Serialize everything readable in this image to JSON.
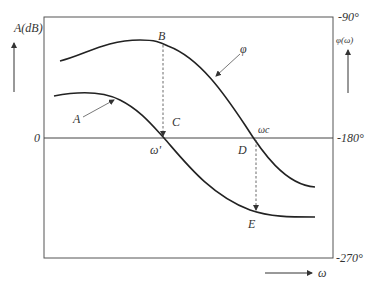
{
  "diagram": {
    "type": "bode-plot",
    "left_axis": {
      "label": "A(dB)",
      "zero_label": "0"
    },
    "right_axis": {
      "label": "φ(ω)",
      "ticks": [
        "-90°",
        "-180°",
        "-270°"
      ]
    },
    "x_axis": {
      "label": "ω"
    },
    "curves": [
      {
        "name": "A",
        "label": "A",
        "description": "amplitude curve"
      },
      {
        "name": "phi",
        "label": "φ",
        "description": "phase curve"
      }
    ],
    "points": {
      "B": "B",
      "C": "C",
      "D": "D",
      "E": "E",
      "omega_prime": "ω'",
      "omega_c": "ωc"
    }
  }
}
